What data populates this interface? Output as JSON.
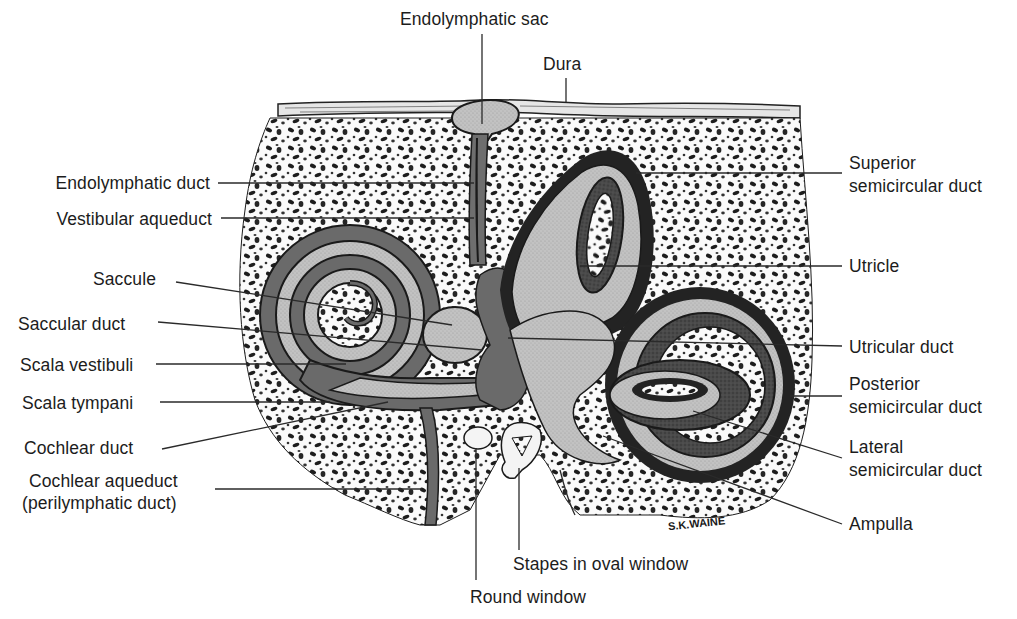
{
  "diagram": {
    "signature": "S.K.WAINE",
    "colors": {
      "background": "#ffffff",
      "bone_speckle": "#1a1a1a",
      "perilymph_dark": "#6e6e6e",
      "endolymph_light": "#bdbdbd",
      "membrane_wall": "#2b2b2b",
      "dura": "#d8d8d8"
    },
    "labels": {
      "endolymphatic_sac": "Endolymphatic sac",
      "dura": "Dura",
      "endolymphatic_duct": "Endolymphatic duct",
      "vestibular_aqueduct": "Vestibular aqueduct",
      "saccule": "Saccule",
      "saccular_duct": "Saccular duct",
      "scala_vestibuli": "Scala vestibuli",
      "scala_tympani": "Scala tympani",
      "cochlear_duct": "Cochlear duct",
      "cochlear_aqueduct_1": "Cochlear aqueduct",
      "cochlear_aqueduct_2": "(perilymphatic duct)",
      "superior_1": "Superior",
      "superior_2": "semicircular duct",
      "utricle": "Utricle",
      "utricular_duct": "Utricular duct",
      "posterior_1": "Posterior",
      "posterior_2": "semicircular duct",
      "lateral_1": "Lateral",
      "lateral_2": "semicircular duct",
      "ampulla": "Ampulla",
      "stapes": "Stapes in oval window",
      "round_window": "Round window"
    }
  }
}
